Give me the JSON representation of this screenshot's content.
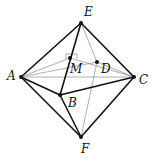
{
  "diagram": {
    "points": {
      "A": {
        "x": 21,
        "y": 77,
        "label": "A"
      },
      "B": {
        "x": 60,
        "y": 95,
        "label": "B"
      },
      "C": {
        "x": 134,
        "y": 77,
        "label": "C"
      },
      "D": {
        "x": 97,
        "y": 62,
        "label": "D"
      },
      "E": {
        "x": 81,
        "y": 23,
        "label": "E"
      },
      "F": {
        "x": 81,
        "y": 137,
        "label": "F"
      },
      "M": {
        "x": 70,
        "y": 58,
        "label": "M"
      }
    },
    "solid_edges": [
      [
        "E",
        "A"
      ],
      [
        "E",
        "C"
      ],
      [
        "E",
        "B"
      ],
      [
        "A",
        "B"
      ],
      [
        "B",
        "C"
      ],
      [
        "A",
        "F"
      ],
      [
        "C",
        "F"
      ],
      [
        "B",
        "F"
      ]
    ],
    "hidden_edges": [
      [
        "E",
        "D"
      ],
      [
        "A",
        "D"
      ],
      [
        "D",
        "C"
      ],
      [
        "D",
        "F"
      ],
      [
        "A",
        "C"
      ],
      [
        "A",
        "M"
      ],
      [
        "M",
        "C"
      ]
    ],
    "right_angle_marker": "M",
    "colors": {
      "line": "#111111",
      "hidden": "#888888"
    }
  }
}
